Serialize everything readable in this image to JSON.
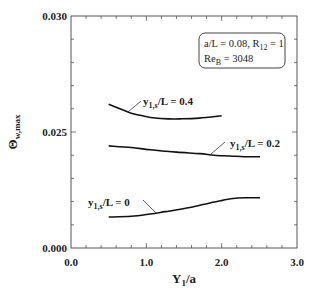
{
  "chart_data": {
    "type": "line",
    "title": "",
    "xlabel": "Y1/a",
    "xlabel_main": "Y",
    "xlabel_sub": "1",
    "xlabel_rest": "/a",
    "ylabel": "Θw,max",
    "ylabel_main": "Θ",
    "ylabel_sub": "w,max",
    "xlim": [
      0.0,
      3.0
    ],
    "ylim": [
      0.0,
      0.03
    ],
    "x_ticks": [
      {
        "value": 0.0,
        "label": "0.0"
      },
      {
        "value": 1.0,
        "label": "1.0"
      },
      {
        "value": 2.0,
        "label": "2.0"
      },
      {
        "value": 3.0,
        "label": "3.0"
      }
    ],
    "y_ticks": [
      {
        "value": 0.0,
        "label": "0.000"
      },
      {
        "value": 0.015,
        "label": "0.025"
      },
      {
        "value": 0.03,
        "label": "0.030"
      }
    ],
    "x_minor_step": 0.2,
    "y_minor_step": 0.003,
    "grid": false,
    "annotation_box": {
      "line1_main": "a/L = 0.08, R",
      "line1_sub": "12",
      "line1_rest": " = 1",
      "line2_main": "Re",
      "line2_sub": "B",
      "line2_rest": " = 3048",
      "placement": "top-right"
    },
    "series": [
      {
        "name": "y1,s/L = 0.4",
        "label_main": "y",
        "label_sub": "1,s",
        "label_rest": "/L = 0.4",
        "x": [
          0.5,
          0.65,
          0.78,
          0.95,
          1.12,
          1.3,
          1.45,
          1.7,
          2.0
        ],
        "y": [
          0.0186,
          0.018,
          0.0175,
          0.0171,
          0.0168,
          0.0167,
          0.0167,
          0.0168,
          0.0171
        ]
      },
      {
        "name": "y1,s/L = 0.2",
        "label_main": "y",
        "label_sub": "1,s",
        "label_rest": "/L = 0.2",
        "x": [
          0.5,
          0.8,
          1.05,
          1.4,
          1.71,
          1.9,
          2.11,
          2.3,
          2.51
        ],
        "y": [
          0.0132,
          0.013,
          0.0127,
          0.0124,
          0.0122,
          0.012,
          0.0119,
          0.0118,
          0.0118
        ]
      },
      {
        "name": "y1,s/L = 0",
        "label_main": "y",
        "label_sub": "1,s",
        "label_rest": "/L = 0",
        "x": [
          0.5,
          0.8,
          1.05,
          1.25,
          1.45,
          1.7,
          1.98,
          2.15,
          2.31,
          2.51
        ],
        "y": [
          0.004,
          0.0041,
          0.0044,
          0.0047,
          0.005,
          0.0055,
          0.0061,
          0.0064,
          0.0065,
          0.0065
        ]
      }
    ]
  }
}
